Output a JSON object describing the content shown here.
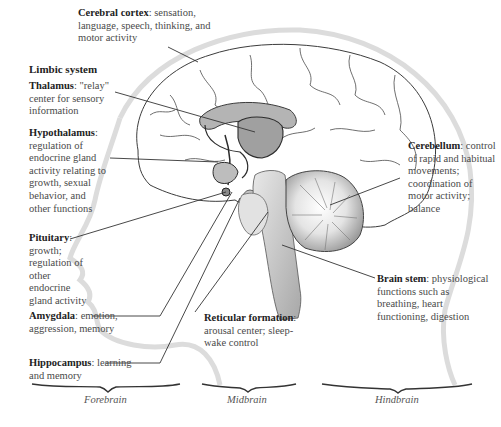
{
  "diagram": {
    "heading_limbic": "Limbic system",
    "labels": {
      "cerebral_cortex": {
        "title": "Cerebral cortex",
        "desc": ": sensation, language, speech, thinking, and motor activity"
      },
      "thalamus": {
        "title": "Thalamus",
        "desc": ": \"relay\" center for sensory information"
      },
      "hypothalamus": {
        "title": "Hypothalamus",
        "desc": ": regulation of endocrine gland activity relating to growth, sexual behavior, and other functions"
      },
      "pituitary": {
        "title": "Pituitary",
        "desc": ": growth; regulation of other endocrine gland activity"
      },
      "amygdala": {
        "title": "Amygdala",
        "desc": ": emotion, aggression, memory"
      },
      "hippocampus": {
        "title": "Hippocampus",
        "desc": ": learning and memory"
      },
      "reticular_formation": {
        "title": "Reticular formation",
        "desc": ": arousal center; sleep-wake control"
      },
      "brain_stem": {
        "title": "Brain stem",
        "desc": ": physiological functions such as breathing, heart functioning, digestion"
      },
      "cerebellum": {
        "title": "Cerebellum",
        "desc": ": control of rapid and habitual movements; coordination of motor activity; balance"
      }
    },
    "sections": {
      "forebrain": "Forebrain",
      "midbrain": "Midbrain",
      "hindbrain": "Hindbrain"
    },
    "colors": {
      "limbic_fill": "#a9a9a9",
      "stem_fill": "#c8c8c8",
      "outline": "#3c3c3c",
      "head_outline": "#d8d8d8"
    }
  }
}
